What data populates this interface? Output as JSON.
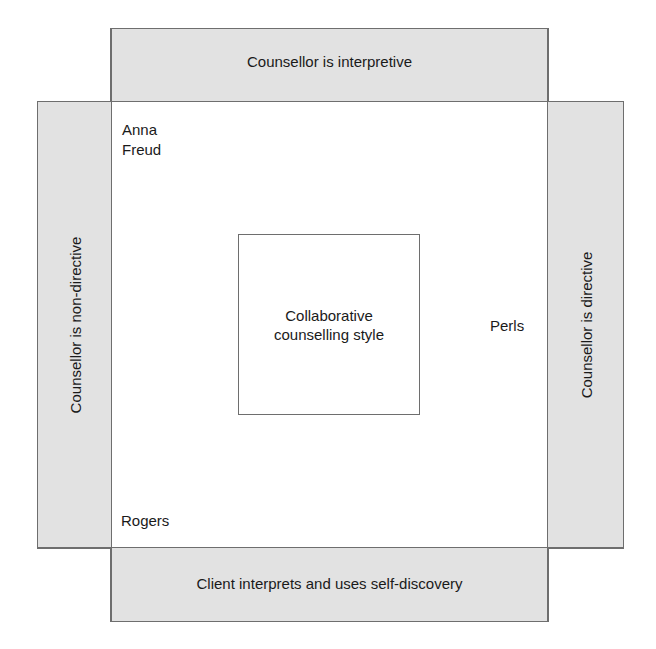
{
  "diagram": {
    "top_band": {
      "label": "Counsellor is interpretive"
    },
    "bottom_band": {
      "label": "Client interprets and uses self-discovery"
    },
    "left_band": {
      "label": "Counsellor is non-directive"
    },
    "right_band": {
      "label": "Counsellor is directive"
    },
    "center_box": {
      "line1": "Collaborative",
      "line2": "counselling style"
    },
    "examples": {
      "top_left": {
        "line1": "Anna",
        "line2": "Freud"
      },
      "bottom_left": {
        "label": "Rogers"
      },
      "right": {
        "label": "Perls"
      }
    },
    "colors": {
      "band_fill": "#e2e2e2",
      "border": "#6e6e6e",
      "text": "#1a1a1a"
    }
  }
}
